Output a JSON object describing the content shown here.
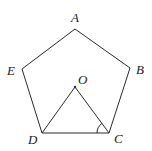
{
  "diagram": {
    "type": "geometry",
    "colors": {
      "stroke": "#2a2a2a",
      "label": "#1a1a1a",
      "background": "#ffffff"
    },
    "points": {
      "A": {
        "label": "A",
        "x": 75,
        "y": 29
      },
      "B": {
        "label": "B",
        "x": 130,
        "y": 68
      },
      "C": {
        "label": "C",
        "x": 109,
        "y": 133
      },
      "D": {
        "label": "D",
        "x": 42,
        "y": 133
      },
      "E": {
        "label": "E",
        "x": 22,
        "y": 69
      },
      "O": {
        "label": "O",
        "x": 75,
        "y": 87
      }
    },
    "polygons": [
      {
        "name": "pentagon",
        "vertices": [
          "A",
          "B",
          "C",
          "D",
          "E"
        ]
      }
    ],
    "segments": [
      {
        "from": "O",
        "to": "D"
      },
      {
        "from": "O",
        "to": "C"
      }
    ],
    "angle_marks": [
      {
        "vertex": "C",
        "between": [
          "O",
          "D"
        ]
      }
    ]
  }
}
